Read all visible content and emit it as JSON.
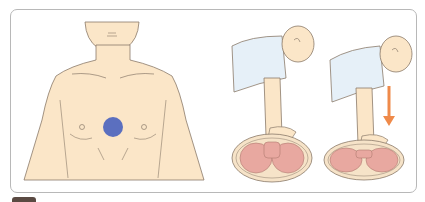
{
  "figure": {
    "panels": [
      {
        "id": "torso",
        "label": "Hand placement location on center of chest",
        "marker_color": "#5b6fbf"
      },
      {
        "id": "rescuer-before",
        "label": "Rescuer with straight arms, hands on chest (before compression)"
      },
      {
        "id": "rescuer-compress",
        "label": "Rescuer pushing down (compression)",
        "arrow_color": "#ef8a4a"
      }
    ],
    "colors": {
      "skin": "#fbe6c8",
      "outline": "#8a7a6a",
      "shirt": "#e6f0f8",
      "chest_section": "#e8a8a0",
      "chest_outer": "#f6e3c8",
      "border": "#b8b8b8"
    }
  }
}
